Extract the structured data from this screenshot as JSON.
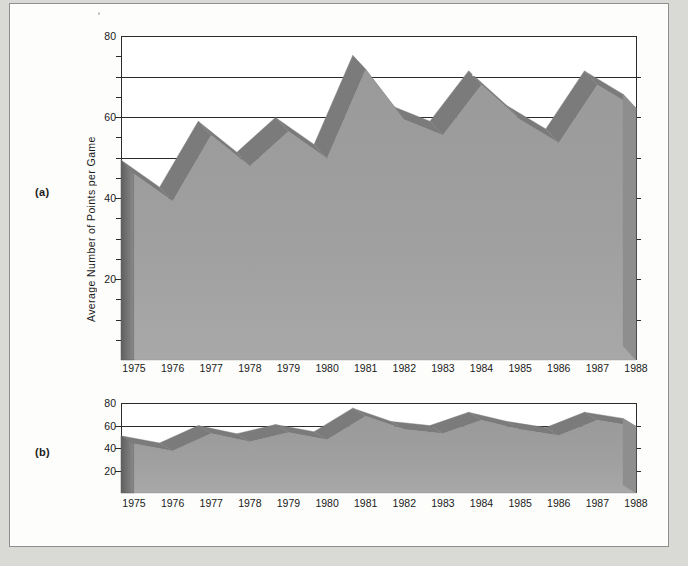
{
  "figure": {
    "panel_a_label": "(a)",
    "panel_b_label": "(b)",
    "y_axis_title": "Average Number of Points per Game"
  },
  "chart_data": {
    "type": "area",
    "title": "",
    "subtitle": "",
    "xlabel": "",
    "ylabel": "Average Number of Points per Game",
    "categories": [
      "1975",
      "1976",
      "1977",
      "1978",
      "1979",
      "1980",
      "1981",
      "1982",
      "1983",
      "1984",
      "1985",
      "1986",
      "1987",
      "1988"
    ],
    "x": [
      1975,
      1976,
      1977,
      1978,
      1979,
      1980,
      1981,
      1982,
      1983,
      1984,
      1985,
      1986,
      1987,
      1988
    ],
    "values": [
      48,
      41,
      58,
      50,
      59,
      52,
      75,
      62,
      58,
      71,
      62,
      56,
      71,
      65
    ],
    "series": [
      {
        "name": "Average Number of Points per Game",
        "values": [
          48,
          41,
          58,
          50,
          59,
          52,
          75,
          62,
          58,
          71,
          62,
          56,
          71,
          65
        ]
      }
    ],
    "ylim": [
      0,
      80
    ],
    "yticks": [
      0,
      10,
      20,
      30,
      40,
      50,
      60,
      70,
      80
    ],
    "ytick_labels_shown": [
      "20",
      "40",
      "60",
      "80"
    ],
    "yminor_step": 5,
    "grid": "horizontal",
    "legend": "none",
    "style": "3D ribbon area chart",
    "panels": [
      {
        "id": "a",
        "label": "(a)",
        "aspect": "tall",
        "ylim": [
          0,
          80
        ]
      },
      {
        "id": "b",
        "label": "(b)",
        "aspect": "short",
        "ylim": [
          0,
          80
        ]
      }
    ],
    "note": "Panels (a) and (b) plot the same series at different vertical scales."
  },
  "axis_a": {
    "y_labels": [
      "80",
      "60",
      "40",
      "20"
    ],
    "x_labels": [
      "1975",
      "1976",
      "1977",
      "1978",
      "1979",
      "1980",
      "1981",
      "1982",
      "1983",
      "1984",
      "1985",
      "1986",
      "1987",
      "1988"
    ]
  },
  "axis_b": {
    "y_labels": [
      "80",
      "60",
      "40",
      "20"
    ],
    "x_labels": [
      "1975",
      "1976",
      "1977",
      "1978",
      "1979",
      "1980",
      "1981",
      "1982",
      "1983",
      "1984",
      "1985",
      "1986",
      "1987",
      "1988"
    ]
  },
  "colors": {
    "page_background": "#d9d9d6",
    "panel_background": "#fdfdfb",
    "plot_background": "#ffffff",
    "area_fill_top": "#9a9a9a",
    "area_fill_bottom": "#a8a8a8",
    "ribbon_top_face": "#7b7b7b",
    "side_face": "#6f6f6f",
    "axis_line": "#2b2b2b",
    "text": "#1a1a1a"
  }
}
